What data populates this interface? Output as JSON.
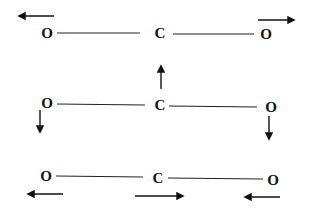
{
  "diagram": {
    "colors": {
      "ink": "#111111",
      "background": "#ffffff"
    },
    "modes": [
      {
        "name": "symmetric-stretch",
        "atoms": [
          {
            "label": "O",
            "x": 47,
            "y": 33
          },
          {
            "label": "C",
            "x": 160,
            "y": 33
          },
          {
            "label": "O",
            "x": 266,
            "y": 34
          }
        ],
        "bonds": [
          {
            "x1": 57,
            "y1": 33,
            "x2": 140,
            "y2": 33
          },
          {
            "x1": 173,
            "y1": 34,
            "x2": 254,
            "y2": 34
          }
        ],
        "arrows": [
          {
            "dir": "left",
            "x1": 54,
            "y1": 16,
            "x2": 19,
            "y2": 16
          },
          {
            "dir": "right",
            "x1": 258,
            "y1": 20,
            "x2": 294,
            "y2": 20
          }
        ]
      },
      {
        "name": "bending",
        "atoms": [
          {
            "label": "O",
            "x": 47,
            "y": 103
          },
          {
            "label": "C",
            "x": 160,
            "y": 105
          },
          {
            "label": "O",
            "x": 271,
            "y": 107
          }
        ],
        "bonds": [
          {
            "x1": 57,
            "y1": 104,
            "x2": 145,
            "y2": 105
          },
          {
            "x1": 169,
            "y1": 106,
            "x2": 257,
            "y2": 107
          }
        ],
        "arrows": [
          {
            "dir": "up",
            "x1": 161,
            "y1": 89,
            "x2": 161,
            "y2": 66
          },
          {
            "dir": "down",
            "x1": 40,
            "y1": 110,
            "x2": 40,
            "y2": 132
          },
          {
            "dir": "down",
            "x1": 269,
            "y1": 116,
            "x2": 269,
            "y2": 139
          }
        ]
      },
      {
        "name": "asymmetric-stretch",
        "atoms": [
          {
            "label": "O",
            "x": 46,
            "y": 176
          },
          {
            "label": "C",
            "x": 158,
            "y": 178
          },
          {
            "label": "O",
            "x": 273,
            "y": 180
          }
        ],
        "bonds": [
          {
            "x1": 56,
            "y1": 176,
            "x2": 143,
            "y2": 177
          },
          {
            "x1": 168,
            "y1": 178,
            "x2": 263,
            "y2": 179
          }
        ],
        "arrows": [
          {
            "dir": "left",
            "x1": 63,
            "y1": 194,
            "x2": 28,
            "y2": 194
          },
          {
            "dir": "right",
            "x1": 135,
            "y1": 196,
            "x2": 183,
            "y2": 196
          },
          {
            "dir": "left",
            "x1": 280,
            "y1": 197,
            "x2": 245,
            "y2": 197
          }
        ]
      }
    ]
  }
}
